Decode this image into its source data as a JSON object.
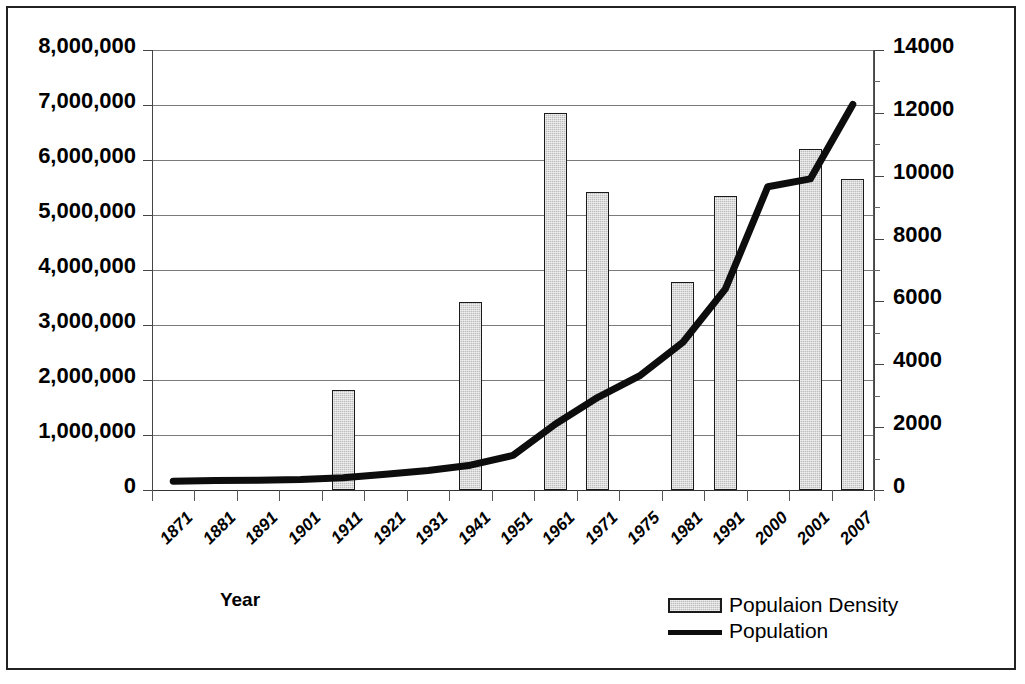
{
  "chart_data": {
    "type": "bar",
    "title": "",
    "xlabel": "Year",
    "ylabel": "",
    "categories": [
      "1871",
      "1881",
      "1891",
      "1901",
      "1911",
      "1921",
      "1931",
      "1941",
      "1951",
      "1961",
      "1971",
      "1975",
      "1981",
      "1991",
      "2000",
      "2001",
      "2007"
    ],
    "grid": true,
    "legend_position": "bottom-right",
    "axes": {
      "left": {
        "label": "",
        "ylim": [
          0,
          8000000
        ],
        "ticks": [
          0,
          1000000,
          2000000,
          3000000,
          4000000,
          5000000,
          6000000,
          7000000,
          8000000
        ],
        "tick_labels": [
          "0",
          "1,000,000",
          "2,000,000",
          "3,000,000",
          "4,000,000",
          "5,000,000",
          "6,000,000",
          "7,000,000",
          "8,000,000"
        ]
      },
      "right": {
        "label": "",
        "ylim": [
          0,
          14000
        ],
        "ticks": [
          0,
          2000,
          4000,
          6000,
          8000,
          10000,
          12000,
          14000
        ],
        "tick_labels": [
          "0",
          "2000",
          "4000",
          "6000",
          "8000",
          "10000",
          "12000",
          "14000"
        ]
      }
    },
    "series": [
      {
        "name": "Populaion Density",
        "type": "bar",
        "axis": "left",
        "color": "#bdbdbd",
        "edge_color": "#1a1a1a",
        "values": [
          null,
          null,
          null,
          null,
          1820000,
          null,
          null,
          3420000,
          null,
          6850000,
          5420000,
          null,
          3780000,
          5350000,
          null,
          6200000,
          5650000
        ]
      },
      {
        "name": "Population",
        "type": "line",
        "axis": "right",
        "color": "#0d0d0d",
        "values": [
          280,
          300,
          310,
          330,
          390,
          500,
          620,
          790,
          1100,
          2100,
          2950,
          3650,
          4700,
          6400,
          9650,
          9900,
          12270
        ]
      }
    ]
  },
  "legend": {
    "entries": [
      {
        "label": "Populaion Density",
        "marker": "bar-swatch"
      },
      {
        "label": "Population",
        "marker": "line-swatch"
      }
    ]
  }
}
